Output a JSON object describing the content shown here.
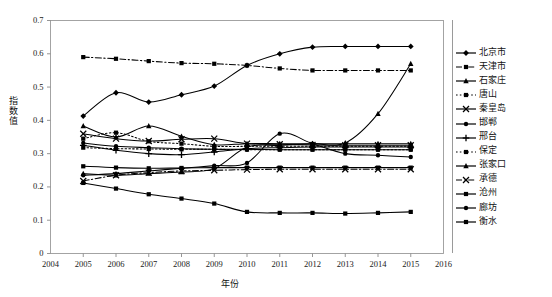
{
  "chart_data": {
    "type": "line",
    "title": "",
    "xlabel": "年份",
    "ylabel": "指数值",
    "xlim": [
      2004,
      2016
    ],
    "ylim": [
      0,
      0.7
    ],
    "x": [
      2005,
      2006,
      2007,
      2008,
      2009,
      2010,
      2011,
      2012,
      2013,
      2014,
      2015
    ],
    "xticks": [
      "2004",
      "2005",
      "2006",
      "2007",
      "2008",
      "2009",
      "2010",
      "2011",
      "2012",
      "2013",
      "2014",
      "2015",
      "2016"
    ],
    "yticks": [
      "0",
      "0.1",
      "0.2",
      "0.3",
      "0.4",
      "0.5",
      "0.6",
      "0.7"
    ],
    "grid": false,
    "legend_position": "right",
    "series": [
      {
        "name": "北京市",
        "marker": "diamond",
        "dash": "solid",
        "values": [
          0.413,
          0.483,
          0.455,
          0.477,
          0.503,
          0.565,
          0.6,
          0.62,
          0.622,
          0.622,
          0.622
        ]
      },
      {
        "name": "天津市",
        "marker": "square",
        "dash": "dashdot",
        "values": [
          0.59,
          0.585,
          0.578,
          0.572,
          0.57,
          0.565,
          0.556,
          0.55,
          0.55,
          0.55,
          0.55
        ]
      },
      {
        "name": "石家庄",
        "marker": "triangle",
        "dash": "solid",
        "values": [
          0.383,
          0.35,
          0.383,
          0.352,
          0.327,
          0.33,
          0.33,
          0.33,
          0.33,
          0.33,
          0.33
        ]
      },
      {
        "name": "唐山",
        "marker": "square",
        "dash": "dotted",
        "values": [
          0.345,
          0.363,
          0.337,
          0.33,
          0.322,
          0.322,
          0.322,
          0.322,
          0.322,
          0.322,
          0.322
        ]
      },
      {
        "name": "秦皇岛",
        "marker": "cross",
        "dash": "solid",
        "values": [
          0.36,
          0.345,
          0.338,
          0.343,
          0.345,
          0.33,
          0.328,
          0.326,
          0.325,
          0.325,
          0.325
        ]
      },
      {
        "name": "邯郸",
        "marker": "circle",
        "dash": "solid",
        "values": [
          0.332,
          0.322,
          0.318,
          0.315,
          0.313,
          0.313,
          0.312,
          0.312,
          0.312,
          0.312,
          0.312
        ]
      },
      {
        "name": "邢台",
        "marker": "plus",
        "dash": "solid",
        "values": [
          0.325,
          0.31,
          0.3,
          0.297,
          0.305,
          0.315,
          0.318,
          0.32,
          0.32,
          0.32,
          0.32
        ]
      },
      {
        "name": "保定",
        "marker": "square",
        "dash": "dotted",
        "values": [
          0.318,
          0.315,
          0.314,
          0.313,
          0.313,
          0.312,
          0.312,
          0.312,
          0.312,
          0.312,
          0.312
        ]
      },
      {
        "name": "张家口",
        "marker": "triangle",
        "dash": "solid",
        "values": [
          0.24,
          0.235,
          0.24,
          0.245,
          0.255,
          0.32,
          0.325,
          0.33,
          0.332,
          0.42,
          0.57
        ]
      },
      {
        "name": "承德",
        "marker": "cross",
        "dash": "dashdot",
        "values": [
          0.218,
          0.235,
          0.243,
          0.248,
          0.25,
          0.252,
          0.253,
          0.253,
          0.253,
          0.253,
          0.253
        ]
      },
      {
        "name": "沧州",
        "marker": "square",
        "dash": "solid",
        "values": [
          0.262,
          0.258,
          0.256,
          0.257,
          0.258,
          0.258,
          0.258,
          0.258,
          0.258,
          0.258,
          0.258
        ]
      },
      {
        "name": "廊坊",
        "marker": "circle",
        "dash": "solid",
        "values": [
          0.235,
          0.24,
          0.248,
          0.256,
          0.264,
          0.272,
          0.36,
          0.33,
          0.3,
          0.295,
          0.29
        ]
      },
      {
        "name": "衡水",
        "marker": "square",
        "dash": "solid",
        "values": [
          0.212,
          0.195,
          0.178,
          0.165,
          0.15,
          0.125,
          0.122,
          0.122,
          0.12,
          0.122,
          0.125
        ]
      }
    ]
  },
  "axis": {
    "y_label": "指数值",
    "x_label": "年份",
    "y_ticks": [
      "0.7",
      "0.6",
      "0.5",
      "0.4",
      "0.3",
      "0.2",
      "0.1",
      "0"
    ],
    "x_ticks": [
      "2004",
      "2005",
      "2006",
      "2007",
      "2008",
      "2009",
      "2010",
      "2011",
      "2012",
      "2013",
      "2014",
      "2015",
      "2016"
    ]
  },
  "legend": {
    "items": [
      {
        "label": "北京市"
      },
      {
        "label": "天津市"
      },
      {
        "label": "石家庄"
      },
      {
        "label": "唐山"
      },
      {
        "label": "秦皇岛"
      },
      {
        "label": "邯郸"
      },
      {
        "label": "邢台"
      },
      {
        "label": "保定"
      },
      {
        "label": "张家口"
      },
      {
        "label": "承德"
      },
      {
        "label": "沧州"
      },
      {
        "label": "廊坊"
      },
      {
        "label": "衡水"
      }
    ]
  },
  "colors": {
    "line": "#000000",
    "axis": "#808080",
    "background": "#ffffff"
  }
}
